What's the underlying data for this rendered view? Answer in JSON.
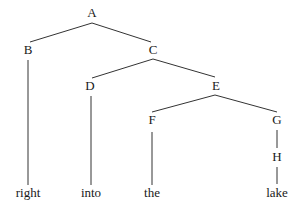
{
  "diagram": {
    "type": "tree",
    "nodes": [
      {
        "id": "A",
        "label": "A",
        "x": 92,
        "y": 17
      },
      {
        "id": "B",
        "label": "B",
        "x": 28,
        "y": 54
      },
      {
        "id": "C",
        "label": "C",
        "x": 153,
        "y": 54
      },
      {
        "id": "D",
        "label": "D",
        "x": 90,
        "y": 90
      },
      {
        "id": "E",
        "label": "E",
        "x": 216,
        "y": 90
      },
      {
        "id": "F",
        "label": "F",
        "x": 152,
        "y": 124
      },
      {
        "id": "G",
        "label": "G",
        "x": 277,
        "y": 124
      },
      {
        "id": "H",
        "label": "H",
        "x": 277,
        "y": 161
      },
      {
        "id": "w1",
        "label": "right",
        "x": 28,
        "y": 197
      },
      {
        "id": "w2",
        "label": "into",
        "x": 91,
        "y": 197
      },
      {
        "id": "w3",
        "label": "the",
        "x": 152,
        "y": 197
      },
      {
        "id": "w4",
        "label": "lake",
        "x": 277,
        "y": 197
      }
    ],
    "edges": [
      {
        "from": "A",
        "to": "B",
        "x1": 92,
        "y1": 23,
        "x2": 30,
        "y2": 42
      },
      {
        "from": "A",
        "to": "C",
        "x1": 92,
        "y1": 23,
        "x2": 151,
        "y2": 42
      },
      {
        "from": "B",
        "to": "w1",
        "x1": 28,
        "y1": 60,
        "x2": 28,
        "y2": 185
      },
      {
        "from": "C",
        "to": "D",
        "x1": 153,
        "y1": 59,
        "x2": 92,
        "y2": 78
      },
      {
        "from": "C",
        "to": "E",
        "x1": 153,
        "y1": 59,
        "x2": 215,
        "y2": 77
      },
      {
        "from": "D",
        "to": "w2",
        "x1": 91,
        "y1": 96,
        "x2": 91,
        "y2": 185
      },
      {
        "from": "E",
        "to": "F",
        "x1": 215,
        "y1": 95,
        "x2": 152,
        "y2": 112
      },
      {
        "from": "E",
        "to": "G",
        "x1": 215,
        "y1": 95,
        "x2": 277,
        "y2": 112
      },
      {
        "from": "F",
        "to": "w3",
        "x1": 152,
        "y1": 132,
        "x2": 152,
        "y2": 185
      },
      {
        "from": "G",
        "to": "H",
        "x1": 277,
        "y1": 130,
        "x2": 277,
        "y2": 148
      },
      {
        "from": "H",
        "to": "w4",
        "x1": 277,
        "y1": 167,
        "x2": 277,
        "y2": 184
      }
    ]
  }
}
